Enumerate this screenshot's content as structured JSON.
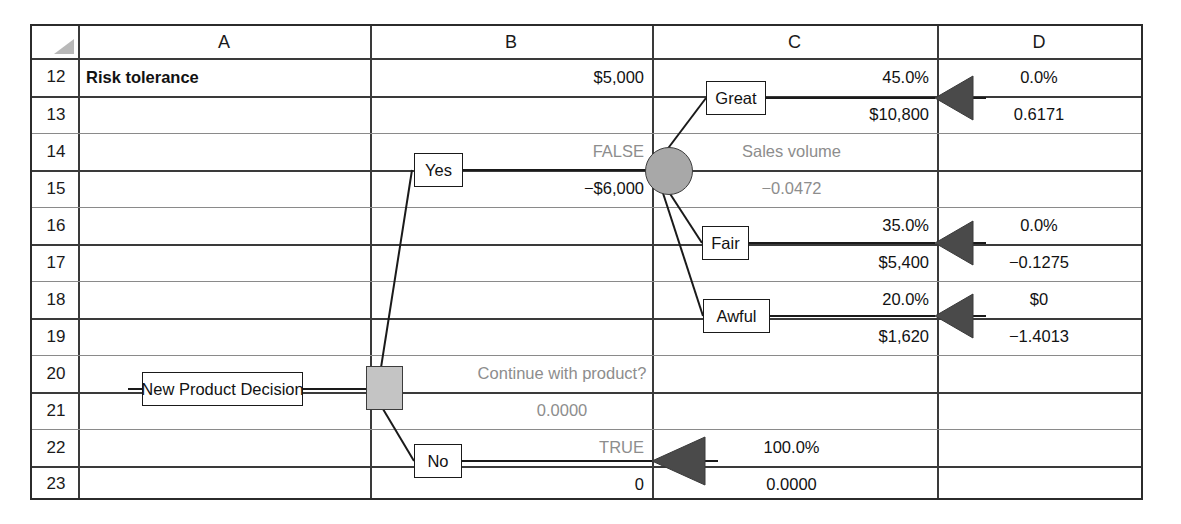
{
  "sheet": {
    "corner_icon": "select-all-triangle-icon",
    "columns": [
      "A",
      "B",
      "C",
      "D"
    ],
    "rows": [
      "12",
      "13",
      "14",
      "15",
      "16",
      "17",
      "18",
      "19",
      "20",
      "21",
      "22",
      "23"
    ]
  },
  "cells": {
    "a12": "Risk tolerance",
    "b12": "$5,000",
    "c12": "45.0%",
    "d12": "0.0%",
    "c13": "$10,800",
    "d13": "0.6171",
    "b14": "FALSE",
    "c14": "Sales volume",
    "b15": "−$6,000",
    "c15": "−0.0472",
    "c16": "35.0%",
    "d16": "0.0%",
    "c17": "$5,400",
    "d17": "−0.1275",
    "c18": "20.0%",
    "d18": "$0",
    "c19": "$1,620",
    "d19": "−1.4013",
    "b20": "Continue with product?",
    "b21": "0.0000",
    "b22": "TRUE",
    "c22": "100.0%",
    "b23": "0",
    "c23": "0.0000"
  },
  "tree": {
    "root_label": "New Product Decision",
    "decision_node": "decision-square-node",
    "chance_node": "chance-circle-node",
    "branches": [
      {
        "label": "Great"
      },
      {
        "label": "Fair"
      },
      {
        "label": "Awful"
      },
      {
        "label": "Yes"
      },
      {
        "label": "No"
      }
    ],
    "endpoints": [
      {
        "name": "endpoint-great"
      },
      {
        "name": "endpoint-fair"
      },
      {
        "name": "endpoint-awful"
      },
      {
        "name": "endpoint-no"
      }
    ]
  },
  "colors": {
    "grid_line": "#8a8a8a",
    "border": "#2b2b2b",
    "gray_text": "#8d8d8d",
    "node_fill": "#a8a8a8",
    "endpoint_fill": "#4a4a4a"
  }
}
